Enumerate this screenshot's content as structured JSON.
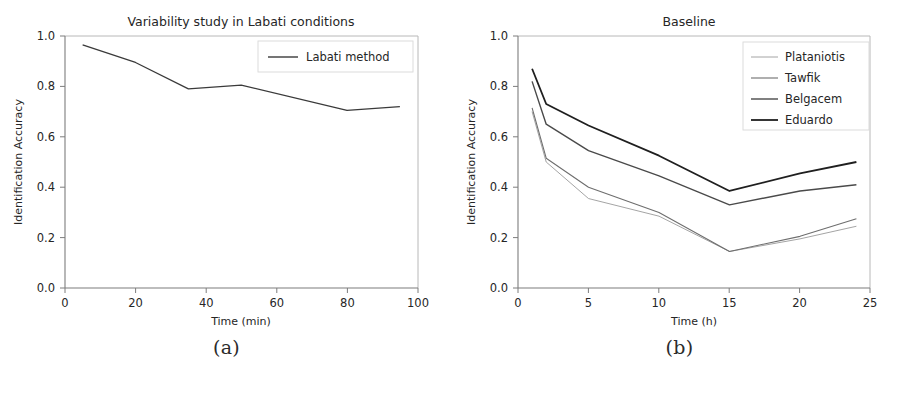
{
  "figures": [
    {
      "caption": "(a)",
      "title": "Variability study in Labati conditions",
      "xlabel": "Time (min)",
      "ylabel": "Identification Accuracy",
      "xticks": [
        "0",
        "20",
        "40",
        "60",
        "80",
        "100"
      ],
      "yticks": [
        "0.0",
        "0.2",
        "0.4",
        "0.6",
        "0.8",
        "1.0"
      ],
      "legend": [
        "Labati method"
      ]
    },
    {
      "caption": "(b)",
      "title": "Baseline",
      "xlabel": "Time (h)",
      "ylabel": "Identification Accuracy",
      "xticks": [
        "0",
        "5",
        "10",
        "15",
        "20",
        "25"
      ],
      "yticks": [
        "0.0",
        "0.2",
        "0.4",
        "0.6",
        "0.8",
        "1.0"
      ],
      "legend": [
        "Plataniotis",
        "Tawfik",
        "Belgacem",
        "Eduardo"
      ]
    }
  ],
  "chart_data": [
    {
      "type": "line",
      "title": "Variability study in Labati conditions",
      "xlabel": "Time (min)",
      "ylabel": "Identification Accuracy",
      "xlim": [
        0,
        100
      ],
      "ylim": [
        0.0,
        1.0
      ],
      "xticks": [
        0,
        20,
        40,
        60,
        80,
        100
      ],
      "yticks": [
        0.0,
        0.2,
        0.4,
        0.6,
        0.8,
        1.0
      ],
      "grid": false,
      "legend_position": "upper right",
      "x": [
        5,
        20,
        35,
        50,
        80,
        95
      ],
      "series": [
        {
          "name": "Labati method",
          "color": "#3a3a3a",
          "linewidth": 1.3,
          "values": [
            0.965,
            0.895,
            0.79,
            0.805,
            0.705,
            0.72
          ]
        }
      ]
    },
    {
      "type": "line",
      "title": "Baseline",
      "xlabel": "Time (h)",
      "ylabel": "Identification Accuracy",
      "xlim": [
        0,
        25
      ],
      "ylim": [
        0.0,
        1.0
      ],
      "xticks": [
        0,
        5,
        10,
        15,
        20,
        25
      ],
      "yticks": [
        0.0,
        0.2,
        0.4,
        0.6,
        0.8,
        1.0
      ],
      "grid": false,
      "legend_position": "upper right",
      "x": [
        1,
        2,
        5,
        10,
        15,
        20,
        24
      ],
      "series": [
        {
          "name": "Plataniotis",
          "color": "#9a9a9a",
          "linewidth": 0.9,
          "values": [
            0.7,
            0.5,
            0.355,
            0.285,
            0.145,
            0.195,
            0.245
          ]
        },
        {
          "name": "Tawfik",
          "color": "#6e6e6e",
          "linewidth": 1.1,
          "values": [
            0.715,
            0.515,
            0.4,
            0.3,
            0.145,
            0.205,
            0.275
          ]
        },
        {
          "name": "Belgacem",
          "color": "#4a4a4a",
          "linewidth": 1.4,
          "values": [
            0.82,
            0.65,
            0.545,
            0.445,
            0.33,
            0.385,
            0.41
          ]
        },
        {
          "name": "Eduardo",
          "color": "#1f1f1f",
          "linewidth": 1.8,
          "values": [
            0.87,
            0.73,
            0.645,
            0.525,
            0.385,
            0.455,
            0.5
          ]
        }
      ]
    }
  ]
}
